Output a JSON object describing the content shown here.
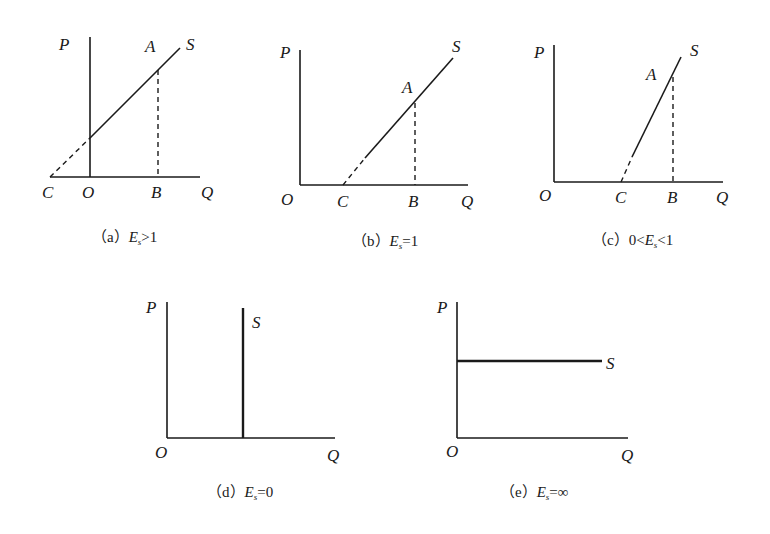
{
  "figure": {
    "panels": [
      {
        "id": "a",
        "caption_prefix": "（a）",
        "caption_var": "E",
        "caption_sub": "s",
        "caption_rel": ">1",
        "labels": {
          "P": "P",
          "Q": "Q",
          "O": "O",
          "A": "A",
          "B": "B",
          "C": "C",
          "S": "S"
        },
        "description": "Supply curve intersects the price axis above origin; extension meets Q axis at C left of O (Es > 1)"
      },
      {
        "id": "b",
        "caption_prefix": "（b）",
        "caption_var": "E",
        "caption_sub": "s",
        "caption_rel": "=1",
        "labels": {
          "P": "P",
          "Q": "Q",
          "O": "O",
          "A": "A",
          "B": "B",
          "C": "C",
          "S": "S"
        },
        "description": "Supply curve extension meets Q axis at C right of O (Es = 1)"
      },
      {
        "id": "c",
        "caption_prefix": "（c）",
        "caption_pre": "0<",
        "caption_var": "E",
        "caption_sub": "s",
        "caption_rel": "<1",
        "labels": {
          "P": "P",
          "Q": "Q",
          "O": "O",
          "A": "A",
          "B": "B",
          "C": "C",
          "S": "S"
        },
        "description": "Steep supply curve; extension meets Q axis at C between O and B (0 < Es < 1)"
      },
      {
        "id": "d",
        "caption_prefix": "（d）",
        "caption_var": "E",
        "caption_sub": "s",
        "caption_rel": "=0",
        "labels": {
          "P": "P",
          "Q": "Q",
          "O": "O",
          "S": "S"
        },
        "description": "Vertical supply curve (perfectly inelastic)"
      },
      {
        "id": "e",
        "caption_prefix": "（e）",
        "caption_var": "E",
        "caption_sub": "s",
        "caption_rel": "=∞",
        "labels": {
          "P": "P",
          "Q": "Q",
          "O": "O",
          "S": "S"
        },
        "description": "Horizontal supply curve (perfectly elastic)"
      }
    ]
  }
}
